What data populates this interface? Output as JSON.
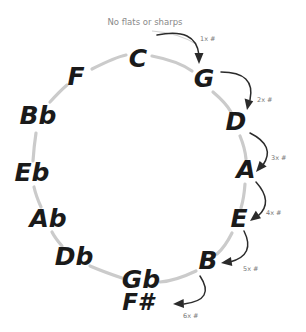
{
  "diagram": {
    "caption": "No flats or sharps",
    "ring_color": "#cbcbcb",
    "note_color": "#1a1a1a",
    "annotation_color": "#777777",
    "background": "#ffffff"
  },
  "notes": [
    {
      "label": "C",
      "x": 138,
      "y": 60,
      "size": "large"
    },
    {
      "label": "G",
      "x": 204,
      "y": 80,
      "size": "large"
    },
    {
      "label": "D",
      "x": 236,
      "y": 123,
      "size": "large"
    },
    {
      "label": "A",
      "x": 246,
      "y": 171,
      "size": "large"
    },
    {
      "label": "E",
      "x": 239,
      "y": 220,
      "size": "large"
    },
    {
      "label": "B",
      "x": 208,
      "y": 262,
      "size": "large"
    },
    {
      "label": "Gb",
      "x": 141,
      "y": 281,
      "size": "large"
    },
    {
      "label": "F#",
      "x": 138,
      "y": 303,
      "size": "small"
    },
    {
      "label": "Db",
      "x": 74,
      "y": 258,
      "size": "large"
    },
    {
      "label": "Ab",
      "x": 48,
      "y": 220,
      "size": "large"
    },
    {
      "label": "Eb",
      "x": 32,
      "y": 174,
      "size": "large"
    },
    {
      "label": "Bb",
      "x": 38,
      "y": 117,
      "size": "large"
    },
    {
      "label": "F",
      "x": 76,
      "y": 78,
      "size": "large"
    }
  ],
  "annotations": [
    {
      "label": "1x #",
      "x": 200,
      "y": 39
    },
    {
      "label": "2x #",
      "x": 257,
      "y": 100
    },
    {
      "label": "3x #",
      "x": 271,
      "y": 158
    },
    {
      "label": "4x #",
      "x": 266,
      "y": 213
    },
    {
      "label": "5x #",
      "x": 243,
      "y": 269
    },
    {
      "label": "6x #",
      "x": 183,
      "y": 316
    }
  ],
  "caption_position": {
    "x": 145,
    "y": 22
  }
}
